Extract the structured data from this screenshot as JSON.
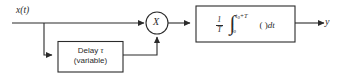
{
  "diagram": {
    "input": {
      "label": "x(t)"
    },
    "output": {
      "label": "y"
    },
    "multiplier": {
      "symbol": "X"
    },
    "delay_block": {
      "line1_prefix": "Delay ",
      "line1_symbol": "τ",
      "line2": "(variable)"
    },
    "integrator_block": {
      "coefficient_numerator": "1",
      "coefficient_denominator": "T",
      "integral_symbol": "∫",
      "upper_limit": "t",
      "upper_limit_sub": "0",
      "upper_limit_suffix": "+T",
      "lower_limit": "t",
      "lower_limit_sub": "0",
      "integrand": "( )",
      "differential": "dt"
    },
    "colors": {
      "stroke": "#2b2b2b",
      "background": "#ffffff",
      "text": "#2b2b2b"
    }
  }
}
